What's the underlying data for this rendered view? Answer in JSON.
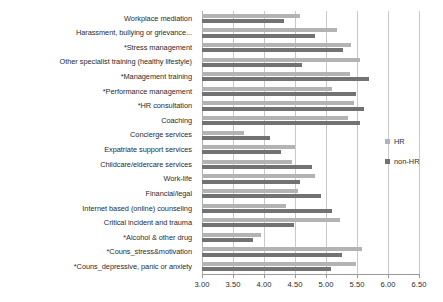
{
  "chart_data": {
    "type": "bar",
    "orientation": "horizontal",
    "title": "",
    "xlabel": "",
    "ylabel": "",
    "xlim": [
      3.0,
      6.5
    ],
    "xticks": [
      3.0,
      3.5,
      4.0,
      4.5,
      5.0,
      5.5,
      6.0,
      6.5
    ],
    "xtick_labels": [
      "3.00",
      "3.50",
      "4.00",
      "4.50",
      "5.00",
      "5.50",
      "6.00",
      "6.50"
    ],
    "grid": true,
    "legend_position": "right",
    "categories": [
      "Workplace mediation",
      "Harassment, bullying or grievance...",
      "*Stress management",
      "Other specialist training (healthy lifestyle)",
      "*Management training",
      "*Performance management",
      "*HR consultation",
      "Coaching",
      "Concierge services",
      "Expatriate support services",
      "Childcare/eldercare services",
      "Work-life",
      "Financial/legal",
      "Internet based (online) counseling",
      "Critical incident and trauma",
      "*Alcohol & other drug",
      "*Couns_stress&motivation",
      "*Couns_depressive, panic or anxiety"
    ],
    "series": [
      {
        "name": "HR",
        "color": "#b3b3b3",
        "values": [
          4.58,
          5.18,
          5.4,
          5.55,
          5.38,
          5.1,
          5.45,
          5.35,
          3.68,
          4.5,
          4.45,
          4.82,
          4.55,
          4.35,
          5.22,
          3.95,
          5.58,
          5.48
        ]
      },
      {
        "name": "non-HR",
        "color": "#727272",
        "values": [
          4.32,
          4.82,
          5.28,
          4.62,
          5.7,
          5.48,
          5.62,
          5.55,
          4.1,
          4.28,
          4.78,
          4.58,
          4.92,
          5.1,
          4.48,
          3.82,
          5.25,
          5.08
        ]
      }
    ]
  },
  "legend": {
    "items": [
      {
        "label": "HR"
      },
      {
        "label": "non-HR"
      }
    ]
  }
}
